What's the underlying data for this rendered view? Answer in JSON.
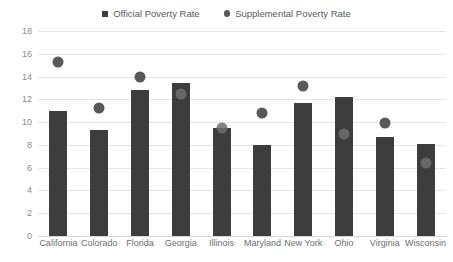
{
  "chart_data": {
    "type": "bar",
    "title": "",
    "xlabel": "",
    "ylabel": "",
    "ylim": [
      0,
      18
    ],
    "ytick_step": 2,
    "yticks": [
      "0",
      "2",
      "4",
      "6",
      "8",
      "10",
      "12",
      "14",
      "16",
      "18"
    ],
    "grid": true,
    "legend_position": "top-center",
    "categories": [
      "California",
      "Colorado",
      "Florida",
      "Georgia",
      "Illinois",
      "Maryland",
      "New York",
      "Ohio",
      "Virginia",
      "Wisconsin"
    ],
    "series": [
      {
        "name": "Official Poverty Rate",
        "marker": "square",
        "color": "#3d3d3d",
        "values": [
          11.0,
          9.3,
          12.8,
          13.4,
          9.5,
          8.0,
          11.7,
          12.2,
          8.7,
          8.1
        ]
      },
      {
        "name": "Supplemental Poverty Rate",
        "marker": "circle",
        "color": "#595959",
        "values": [
          15.3,
          11.2,
          14.0,
          12.5,
          9.5,
          10.8,
          13.2,
          9.0,
          9.9,
          6.4
        ]
      }
    ]
  },
  "legend": {
    "official_label": "Official Poverty Rate",
    "supplemental_label": "Supplemental Poverty Rate"
  },
  "colors": {
    "bar": "#3d3d3d",
    "dot": "#595959",
    "grid": "#e4e4e4",
    "text": "#6e6e6e",
    "background": "#ffffff"
  }
}
